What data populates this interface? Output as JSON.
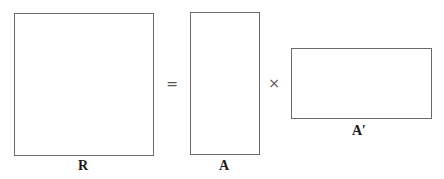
{
  "diagram": {
    "matrices": [
      {
        "id": "R",
        "label": "R",
        "shape": "square"
      },
      {
        "id": "A",
        "label": "A",
        "shape": "tall"
      },
      {
        "id": "A_transpose",
        "label": "A′",
        "shape": "wide"
      }
    ],
    "operators": {
      "equals": "=",
      "times": "×"
    },
    "colors": {
      "border": "#6a6a6a",
      "text": "#1a1a1a",
      "background": "#ffffff"
    }
  }
}
